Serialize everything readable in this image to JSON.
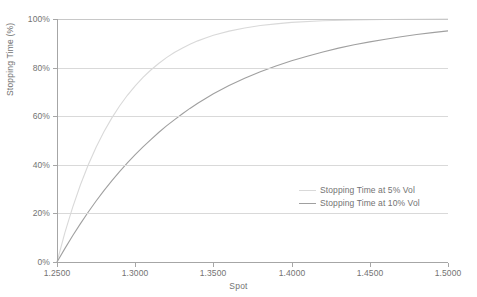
{
  "chart_data": {
    "type": "line",
    "title": "",
    "xlabel": "Spot",
    "ylabel": "Stopping Time (%)",
    "xlim": [
      1.25,
      1.5
    ],
    "ylim": [
      0,
      100
    ],
    "grid": true,
    "legend_position": "inside-right",
    "x_tick_labels": [
      "1.2500",
      "1.3000",
      "1.3500",
      "1.4000",
      "1.4500",
      "1.5000"
    ],
    "x_ticks": [
      1.25,
      1.3,
      1.35,
      1.4,
      1.45,
      1.5
    ],
    "y_tick_labels": [
      "0%",
      "20%",
      "40%",
      "60%",
      "80%",
      "100%"
    ],
    "y_ticks": [
      0,
      20,
      40,
      60,
      80,
      100
    ],
    "series": [
      {
        "name": "Stopping Time at 5% Vol",
        "color": "#d9d9d9",
        "x": [
          1.25,
          1.255,
          1.26,
          1.265,
          1.27,
          1.275,
          1.28,
          1.285,
          1.29,
          1.295,
          1.3,
          1.305,
          1.31,
          1.315,
          1.32,
          1.325,
          1.33,
          1.335,
          1.34,
          1.345,
          1.35,
          1.36,
          1.37,
          1.38,
          1.39,
          1.4,
          1.42,
          1.44,
          1.46,
          1.48,
          1.5
        ],
        "values": [
          0.0,
          12.0,
          22.5,
          31.8,
          40.0,
          47.2,
          53.6,
          59.2,
          64.2,
          68.6,
          72.5,
          76.0,
          79.0,
          81.7,
          84.1,
          86.2,
          88.0,
          89.6,
          91.0,
          92.2,
          93.3,
          95.0,
          96.3,
          97.3,
          98.0,
          98.6,
          99.3,
          99.6,
          99.8,
          99.9,
          100.0
        ]
      },
      {
        "name": "Stopping Time at 10% Vol",
        "color": "#a0a0a0",
        "x": [
          1.25,
          1.255,
          1.26,
          1.265,
          1.27,
          1.275,
          1.28,
          1.285,
          1.29,
          1.295,
          1.3,
          1.305,
          1.31,
          1.315,
          1.32,
          1.325,
          1.33,
          1.335,
          1.34,
          1.345,
          1.35,
          1.36,
          1.37,
          1.38,
          1.39,
          1.4,
          1.41,
          1.42,
          1.43,
          1.44,
          1.45,
          1.46,
          1.47,
          1.48,
          1.49,
          1.5
        ],
        "values": [
          0.0,
          5.5,
          10.8,
          15.8,
          20.6,
          25.1,
          29.4,
          33.4,
          37.2,
          40.8,
          44.2,
          47.4,
          50.4,
          53.3,
          56.0,
          58.5,
          60.9,
          63.2,
          65.3,
          67.3,
          69.2,
          72.6,
          75.6,
          78.3,
          80.7,
          82.8,
          84.7,
          86.4,
          88.0,
          89.4,
          90.6,
          91.7,
          92.7,
          93.6,
          94.4,
          95.1
        ]
      }
    ]
  },
  "axis": {
    "y_label": "Stopping Time (%)",
    "x_label": "Spot"
  },
  "legend": {
    "entries": [
      {
        "label": "Stopping Time at 5% Vol"
      },
      {
        "label": "Stopping Time at 10% Vol"
      }
    ]
  }
}
